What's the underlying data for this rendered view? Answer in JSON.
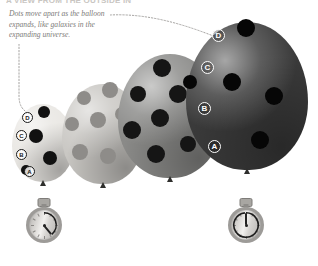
{
  "page": {
    "cutoff_title": "A VIEW FROM THE OUTSIDE IN",
    "background_color": "#ffffff",
    "width": 318,
    "height": 266
  },
  "caption": {
    "text": "Dots move apart as the balloon expands, like galaxies in the expanding universe.",
    "color": "#7d7b78"
  },
  "leaders": [
    {
      "name": "caption-to-large-balloon",
      "from": [
        110,
        14
      ],
      "to": [
        214,
        38
      ],
      "style": "dotted"
    },
    {
      "name": "caption-to-small-balloon",
      "from": [
        20,
        44
      ],
      "to": [
        27,
        112
      ],
      "style": "dotted"
    }
  ],
  "balloons": [
    {
      "id": "balloon-1",
      "stage": 1,
      "fill": "#e9e7e3",
      "dot_color": "#111111",
      "letter_style": "dark",
      "x": 12,
      "y": 104,
      "width": 62,
      "height": 78,
      "letters": [
        {
          "label": "D",
          "x": 10,
          "y": 8
        },
        {
          "label": "C",
          "x": 4,
          "y": 26
        },
        {
          "label": "B",
          "x": 4,
          "y": 45
        },
        {
          "label": "A",
          "x": 12,
          "y": 62
        }
      ],
      "dots": [
        {
          "x": 32,
          "y": 8,
          "r": 6
        },
        {
          "x": 24,
          "y": 32,
          "r": 7
        },
        {
          "x": 38,
          "y": 54,
          "r": 7
        },
        {
          "x": 14,
          "y": 66,
          "r": 5
        }
      ]
    },
    {
      "id": "balloon-2",
      "stage": 2,
      "fill": "#c9c7c3",
      "dot_color": "#8e8c89",
      "letter_style": "none",
      "x": 62,
      "y": 84,
      "width": 82,
      "height": 100,
      "letters": [],
      "dots": [
        {
          "x": 22,
          "y": 14,
          "r": 7
        },
        {
          "x": 48,
          "y": 6,
          "r": 8
        },
        {
          "x": 10,
          "y": 40,
          "r": 7
        },
        {
          "x": 36,
          "y": 36,
          "r": 8
        },
        {
          "x": 60,
          "y": 30,
          "r": 7
        },
        {
          "x": 18,
          "y": 68,
          "r": 8
        },
        {
          "x": 46,
          "y": 72,
          "r": 8
        },
        {
          "x": 66,
          "y": 58,
          "r": 6
        }
      ]
    },
    {
      "id": "balloon-3",
      "stage": 3,
      "fill": "#8a8a88",
      "dot_color": "#151515",
      "letter_style": "none",
      "x": 118,
      "y": 54,
      "width": 104,
      "height": 124,
      "letters": [],
      "dots": [
        {
          "x": 20,
          "y": 40,
          "r": 8
        },
        {
          "x": 44,
          "y": 14,
          "r": 9
        },
        {
          "x": 14,
          "y": 76,
          "r": 9
        },
        {
          "x": 42,
          "y": 64,
          "r": 9
        },
        {
          "x": 60,
          "y": 40,
          "r": 9
        },
        {
          "x": 38,
          "y": 100,
          "r": 9
        },
        {
          "x": 70,
          "y": 90,
          "r": 8
        }
      ]
    },
    {
      "id": "balloon-4",
      "stage": 4,
      "fill": "#3a3a3a",
      "dot_color": "#060606",
      "letter_style": "light",
      "x": 186,
      "y": 22,
      "width": 122,
      "height": 148,
      "letters": [
        {
          "label": "D",
          "x": 26,
          "y": 7
        },
        {
          "label": "C",
          "x": 15,
          "y": 39
        },
        {
          "label": "B",
          "x": 12,
          "y": 80
        },
        {
          "label": "A",
          "x": 22,
          "y": 118
        }
      ],
      "dots": [
        {
          "x": 60,
          "y": 6,
          "r": 9
        },
        {
          "x": 46,
          "y": 60,
          "r": 9
        },
        {
          "x": 88,
          "y": 74,
          "r": 9
        },
        {
          "x": 74,
          "y": 118,
          "r": 9
        },
        {
          "x": 4,
          "y": 60,
          "r": 7
        }
      ]
    }
  ],
  "stopwatches": [
    {
      "id": "stopwatch-start",
      "label": "start",
      "x": 26,
      "y": 198,
      "hand_angle_deg": 140,
      "arc_from_deg": 0,
      "arc_to_deg": 140
    },
    {
      "id": "stopwatch-end",
      "label": "end",
      "x": 228,
      "y": 198,
      "hand_angle_deg": 0,
      "arc_from_deg": 0,
      "arc_to_deg": 355
    }
  ]
}
